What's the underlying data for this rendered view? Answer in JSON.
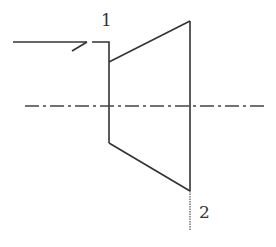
{
  "diagram": {
    "type": "turbine-schematic",
    "stations": [
      {
        "id": "inlet",
        "label": "1"
      },
      {
        "id": "outlet",
        "label": "2"
      }
    ],
    "elements": {
      "inlet_arrow": "flow-in-arrow",
      "body": "trapezoid-turbine",
      "axis": "dash-dot-centerline",
      "outlet_line": "dotted-exit-line"
    },
    "colors": {
      "stroke": "#333333",
      "centerline": "#444444",
      "background": "#ffffff"
    }
  }
}
